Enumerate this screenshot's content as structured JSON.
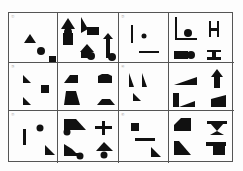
{
  "puzzle": {
    "type": "figure-reasoning-grid",
    "rows": 3,
    "columns_per_row": 2,
    "problems": [
      {
        "label": "①",
        "question_shapes": [
          "triangle",
          "circle",
          "square"
        ],
        "options": [
          "triangle-circle-rect stack",
          "triangle-square combo",
          "triangle-circle combo",
          "arrow-circle combo"
        ]
      },
      {
        "label": "②",
        "question_shapes": [
          "vertical-line",
          "dot",
          "horizontal-line"
        ],
        "options": [
          "L-shape with circle",
          "H-shape",
          "rect with circle",
          "I-beam"
        ]
      },
      {
        "label": "③",
        "question_shapes": [
          "right-triangle",
          "square",
          "right-triangle"
        ],
        "options": [
          "trapezoid",
          "octagon block",
          "quadrilateral",
          "trapezoid flat"
        ]
      },
      {
        "label": "④",
        "question_shapes": [
          "right-triangle",
          "right-triangle",
          "right-triangle"
        ],
        "options": [
          "wedge",
          "arrow",
          "L-block with wedge",
          "wedge tall"
        ]
      },
      {
        "label": "⑤",
        "question_shapes": [
          "vertical-bar",
          "circle",
          "right-triangle"
        ],
        "options": [
          "trapezoid with circle",
          "cross",
          "triangle-bar with circle",
          "triangle with circle"
        ]
      },
      {
        "label": "⑥",
        "question_shapes": [
          "square",
          "horizontal-bar",
          "right-triangle"
        ],
        "options": [
          "pentagon",
          "hourglass T",
          "L-wedge",
          "T-block"
        ]
      }
    ]
  }
}
